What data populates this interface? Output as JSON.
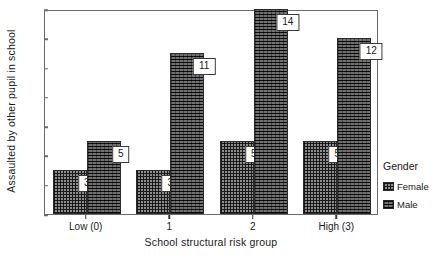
{
  "chart_data": {
    "type": "bar",
    "title": "",
    "xlabel": "School structural risk group",
    "ylabel": "Assaulted by other pupil in school",
    "categories": [
      "Low (0)",
      "1",
      "2",
      "High (3)"
    ],
    "series": [
      {
        "name": "Female",
        "values": [
          3,
          3,
          5,
          5
        ]
      },
      {
        "name": "Male",
        "values": [
          5,
          11,
          14,
          12
        ]
      }
    ],
    "ylim": [
      0,
      14
    ],
    "yticks": [
      0,
      2,
      4,
      6,
      8,
      10,
      12,
      14
    ],
    "ytick_labels": [
      "0",
      "2",
      "4",
      "6",
      "8",
      "10",
      "12",
      "14"
    ],
    "grid": false,
    "legend": {
      "title": "Gender",
      "position": "right",
      "entries": [
        "Female",
        "Male"
      ]
    },
    "data_labels": [
      "3",
      "5",
      "3",
      "11",
      "5",
      "14",
      "5",
      "12"
    ]
  },
  "caption": "",
  "colors": {
    "female": "#8d8d8d",
    "male": "#2e2e2e",
    "frame": "#6a6a6a",
    "text": "#1a1a1a",
    "label_box_bg": "#ffffff"
  }
}
